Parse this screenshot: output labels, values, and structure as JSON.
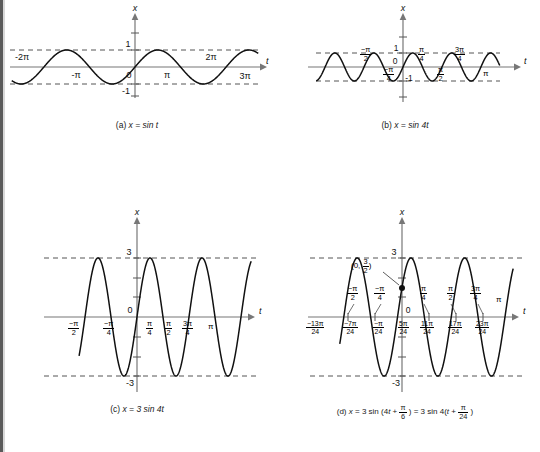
{
  "figure": {
    "title_hidden": "Graphs of sine functions",
    "panels": [
      {
        "id": "a",
        "caption_prefix": "(a)",
        "caption_expr": "x = sin t",
        "function": "x = sin t",
        "amplitude": 1,
        "angular_frequency": 1,
        "phase": 0,
        "y_axis_label": "x",
        "x_axis_label": "t",
        "origin_label": "0",
        "y_tick_labels": [
          "1",
          "-1"
        ],
        "x_tick_labels": [
          "-2π",
          "-π",
          "π",
          "2π",
          "3π"
        ],
        "envelope_labels": [
          "1",
          "-1"
        ],
        "domain": [
          -7.2,
          10.4
        ],
        "range": [
          -1.35,
          1.35
        ]
      },
      {
        "id": "b",
        "caption_prefix": "(b)",
        "caption_expr": "x = sin 4t",
        "function": "x = sin 4t",
        "amplitude": 1,
        "angular_frequency": 4,
        "phase": 0,
        "y_axis_label": "x",
        "x_axis_label": "t",
        "origin_label": "0",
        "y_tick_labels": [
          "1",
          "-1"
        ],
        "x_tick_labels_upper": [
          "-π/2",
          "π/4",
          "3π/4"
        ],
        "x_tick_labels_lower": [
          "-π/4",
          "π/2",
          "π"
        ],
        "domain": [
          -2.6,
          3.6
        ],
        "range": [
          -1.35,
          1.35
        ]
      },
      {
        "id": "c",
        "caption_prefix": "(c)",
        "caption_expr": "x = 3 sin 4t",
        "function": "x = 3 sin 4t",
        "amplitude": 3,
        "angular_frequency": 4,
        "phase": 0,
        "y_axis_label": "x",
        "x_axis_label": "t",
        "origin_label": "0",
        "y_tick_labels": [
          "3",
          "-3"
        ],
        "x_tick_labels": [
          "-π/2",
          "-π/4",
          "π/4",
          "π/2",
          "3π/4",
          "π"
        ],
        "domain": [
          -1.85,
          3.9
        ],
        "range": [
          -3.6,
          3.6
        ]
      },
      {
        "id": "d",
        "caption_prefix": "(d)",
        "caption_expr": "x = 3 sin (4t + π/6) = 3 sin 4(t + π/24)",
        "function": "x = 3 sin (4t + pi/6)",
        "amplitude": 3,
        "angular_frequency": 4,
        "phase": 0.5235987756,
        "y_axis_label": "x",
        "x_axis_label": "t",
        "origin_label": "0",
        "y_tick_labels": [
          "3",
          "-3"
        ],
        "x_tick_labels_upper": [
          "-π/2",
          "-π/4",
          "π/4",
          "π/2",
          "3π/4",
          "π"
        ],
        "x_tick_labels_lower": [
          "-13π/24",
          "-7π/24",
          "-π/24",
          "5π/24",
          "11π/24",
          "17π/24",
          "23π/24"
        ],
        "point_label": "(0, 3/2)",
        "point_value": [
          0,
          1.5
        ],
        "domain": [
          -1.95,
          3.75
        ],
        "range": [
          -3.6,
          3.6
        ]
      }
    ]
  },
  "chart_data": [
    {
      "type": "line",
      "title": "(a) x = sin t",
      "xlabel": "t",
      "ylabel": "x",
      "expression": "x = sin(t)",
      "amplitude": 1,
      "period": "2π",
      "xlim": [
        -7.2,
        10.4
      ],
      "ylim": [
        -1.35,
        1.35
      ],
      "xticks": [
        -6.2832,
        -3.1416,
        0,
        3.1416,
        6.2832,
        9.4248
      ],
      "xticklabels": [
        "-2π",
        "-π",
        "0",
        "π",
        "2π",
        "3π"
      ],
      "yticks": [
        -1,
        1
      ],
      "yticklabels": [
        "-1",
        "1"
      ],
      "grid": false,
      "guide_lines": [
        1,
        -1
      ],
      "guide_style": "dashed"
    },
    {
      "type": "line",
      "title": "(b) x = sin 4t",
      "xlabel": "t",
      "ylabel": "x",
      "expression": "x = sin(4t)",
      "amplitude": 1,
      "period": "π/2",
      "xlim": [
        -2.6,
        3.6
      ],
      "ylim": [
        -1.35,
        1.35
      ],
      "xticks": [
        -1.5708,
        -0.7854,
        0,
        0.7854,
        1.5708,
        2.3562,
        3.1416
      ],
      "xticklabels": [
        "-π/2",
        "-π/4",
        "0",
        "π/4",
        "π/2",
        "3π/4",
        "π"
      ],
      "yticks": [
        -1,
        1
      ],
      "yticklabels": [
        "-1",
        "1"
      ],
      "grid": false,
      "guide_lines": [
        1,
        -1
      ],
      "guide_style": "dashed"
    },
    {
      "type": "line",
      "title": "(c) x = 3 sin 4t",
      "xlabel": "t",
      "ylabel": "x",
      "expression": "x = 3 sin(4t)",
      "amplitude": 3,
      "period": "π/2",
      "xlim": [
        -1.85,
        3.9
      ],
      "ylim": [
        -3.6,
        3.6
      ],
      "xticks": [
        -1.5708,
        -0.7854,
        0,
        0.7854,
        1.5708,
        2.3562,
        3.1416
      ],
      "xticklabels": [
        "-π/2",
        "-π/4",
        "0",
        "π/4",
        "π/2",
        "3π/4",
        "π"
      ],
      "yticks": [
        -3,
        3
      ],
      "yticklabels": [
        "-3",
        "3"
      ],
      "grid": false,
      "guide_lines": [
        3,
        -3
      ],
      "guide_style": "dashed"
    },
    {
      "type": "line",
      "title": "(d) x = 3 sin (4t + π/6) = 3 sin 4(t + π/24)",
      "xlabel": "t",
      "ylabel": "x",
      "expression": "x = 3 sin(4t + π/6)",
      "amplitude": 3,
      "period": "π/2",
      "phase_shift": "-π/24",
      "xlim": [
        -1.95,
        3.75
      ],
      "ylim": [
        -3.6,
        3.6
      ],
      "xticks": [
        -1.5708,
        -0.7854,
        0,
        0.7854,
        1.5708,
        2.3562,
        3.1416
      ],
      "xticklabels": [
        "-π/2",
        "-π/4",
        "0",
        "π/4",
        "π/2",
        "3π/4",
        "π"
      ],
      "zero_crossing_labels": [
        "-13π/24",
        "-7π/24",
        "-π/24",
        "5π/24",
        "11π/24",
        "17π/24",
        "23π/24"
      ],
      "yticks": [
        -3,
        3
      ],
      "yticklabels": [
        "-3",
        "3"
      ],
      "annotations": [
        {
          "label": "(0, 3/2)",
          "x": 0,
          "y": 1.5
        }
      ],
      "grid": false,
      "guide_lines": [
        3,
        -3
      ],
      "guide_style": "dashed"
    }
  ]
}
